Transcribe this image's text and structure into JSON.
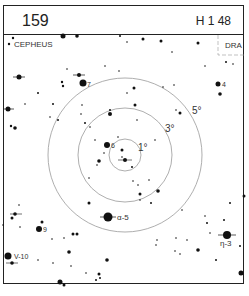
{
  "header": {
    "chart_number": "159",
    "hour_range": "H 1 48"
  },
  "labels": {
    "constellation_left": "CEPHEUS",
    "constellation_right": "DRA"
  },
  "rings": [
    {
      "label": "1°",
      "r": 16
    },
    {
      "label": "3°",
      "r": 47
    },
    {
      "label": "5°",
      "r": 77
    }
  ],
  "center": {
    "x": 125,
    "y": 155
  },
  "named_stars": [
    {
      "label": "7",
      "x": 83,
      "y": 83
    },
    {
      "label": "4",
      "x": 218,
      "y": 84
    },
    {
      "label": "6",
      "x": 107,
      "y": 145
    },
    {
      "label": "α-5",
      "x": 108,
      "y": 217
    },
    {
      "label": "9",
      "x": 39,
      "y": 229
    },
    {
      "label": "V-10",
      "x": 8,
      "y": 256
    },
    {
      "label": "η-3",
      "x": 227,
      "y": 235
    }
  ]
}
